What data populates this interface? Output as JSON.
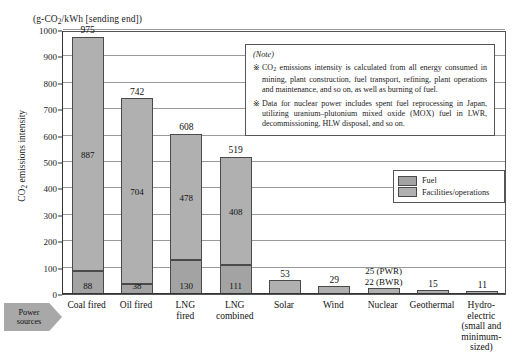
{
  "figure": {
    "axis_unit_title": "(g-CO2/kWh [sending end])",
    "y_axis_label": "CO2 emissions intensity",
    "power_sources_tag_line1": "Power",
    "power_sources_tag_line2": "sources"
  },
  "legend": {
    "items": [
      {
        "label": "Fuel",
        "color": "#a3a3a3"
      },
      {
        "label": "Facilities/operations",
        "color": "#b0b0b0"
      }
    ]
  },
  "note": {
    "title": "(Note)",
    "mark": "※",
    "items": [
      "CO2 emissions intensity is calculated from all energy consumed in mining, plant construction, fuel transport, refining, plant operations and maintenance, and so on, as well as burning of fuel.",
      "Data for nuclear power includes spent fuel reprocessing in Japan, utilizing uranium–plutonium mixed oxide (MOX) fuel in LWR, decommissioning, HLW disposal, and so on."
    ]
  },
  "chart_data": {
    "type": "bar",
    "title": "(g-CO2/kWh [sending end])",
    "xlabel": "Power sources",
    "ylabel": "CO2 emissions intensity",
    "ylim": [
      0,
      1000
    ],
    "yticks": [
      0,
      100,
      200,
      300,
      400,
      500,
      600,
      700,
      800,
      900,
      1000
    ],
    "grid": true,
    "stacked": true,
    "legend_position": "right",
    "categories": [
      "Coal fired",
      "Oil fired",
      "LNG fired",
      "LNG combined",
      "Solar",
      "Wind",
      "Nuclear",
      "Geothermal",
      "Hydro-electric (small and minimum-sized)"
    ],
    "category_label_lines": [
      [
        "Coal fired"
      ],
      [
        "Oil fired"
      ],
      [
        "LNG",
        "fired"
      ],
      [
        "LNG",
        "combined"
      ],
      [
        "Solar"
      ],
      [
        "Wind"
      ],
      [
        "Nuclear"
      ],
      [
        "Geothermal"
      ],
      [
        "Hydro-",
        "electric",
        "(small and",
        "minimum-sized)"
      ]
    ],
    "series": [
      {
        "name": "Fuel",
        "values": [
          88,
          38,
          130,
          111,
          null,
          null,
          null,
          null,
          null
        ]
      },
      {
        "name": "Facilities/operations",
        "values": [
          887,
          704,
          478,
          408,
          null,
          null,
          null,
          null,
          null
        ]
      }
    ],
    "totals": [
      975,
      742,
      608,
      519,
      53,
      29,
      22,
      15,
      11
    ],
    "extra_annotations": [
      {
        "category": "Nuclear",
        "text": "25  (PWR)"
      },
      {
        "category": "Nuclear",
        "text": "22  (BWR)"
      }
    ]
  }
}
